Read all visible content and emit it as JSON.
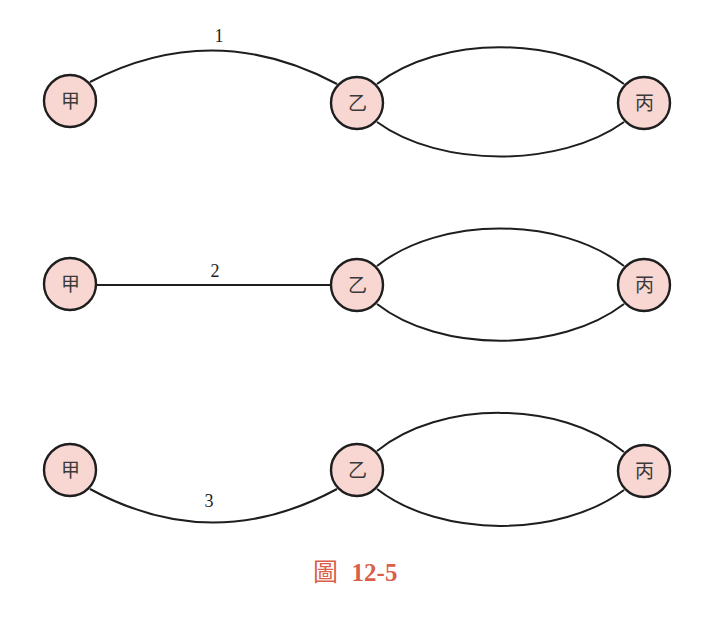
{
  "diagram": {
    "node_fill": "#f8d6d1",
    "stroke": "#1e1e1e",
    "rows": [
      {
        "id": "row1",
        "nodes": [
          {
            "label": "甲",
            "x": 70,
            "y": 101
          },
          {
            "label": "乙",
            "x": 357,
            "y": 103
          },
          {
            "label": "丙",
            "x": 644,
            "y": 103
          }
        ],
        "edges": [
          {
            "from": "甲",
            "to": "乙",
            "shape": "arc-up",
            "label": "1",
            "label_x": 219,
            "label_y": 42
          },
          {
            "from": "乙",
            "to": "丙",
            "shape": "arc-up",
            "label": ""
          },
          {
            "from": "乙",
            "to": "丙",
            "shape": "arc-down",
            "label": ""
          }
        ]
      },
      {
        "id": "row2",
        "nodes": [
          {
            "label": "甲",
            "x": 70,
            "y": 284
          },
          {
            "label": "乙",
            "x": 357,
            "y": 285
          },
          {
            "label": "丙",
            "x": 644,
            "y": 285
          }
        ],
        "edges": [
          {
            "from": "甲",
            "to": "乙",
            "shape": "straight",
            "label": "2",
            "label_x": 215,
            "label_y": 277
          },
          {
            "from": "乙",
            "to": "丙",
            "shape": "arc-up",
            "label": ""
          },
          {
            "from": "乙",
            "to": "丙",
            "shape": "arc-down",
            "label": ""
          }
        ]
      },
      {
        "id": "row3",
        "nodes": [
          {
            "label": "甲",
            "x": 70,
            "y": 470
          },
          {
            "label": "乙",
            "x": 357,
            "y": 470
          },
          {
            "label": "丙",
            "x": 644,
            "y": 471
          }
        ],
        "edges": [
          {
            "from": "甲",
            "to": "乙",
            "shape": "arc-down",
            "label": "3",
            "label_x": 209,
            "label_y": 507
          },
          {
            "from": "乙",
            "to": "丙",
            "shape": "arc-up",
            "label": ""
          },
          {
            "from": "乙",
            "to": "丙",
            "shape": "arc-down",
            "label": ""
          }
        ]
      }
    ]
  },
  "caption": {
    "prefix": "圖",
    "number": "12-5",
    "color": "#d95f4b"
  }
}
